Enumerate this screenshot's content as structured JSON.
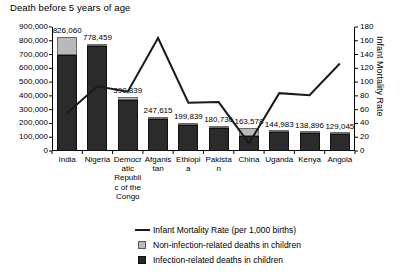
{
  "chart_data": {
    "type": "bar",
    "title": "Death before 5 years of age",
    "xlabel": "",
    "ylabel": "",
    "y2label": "Infant Mortality Rate",
    "grid": false,
    "legend_position": "bottom",
    "ylim": [
      0,
      900000
    ],
    "ytick_step": 100000,
    "y2lim": [
      0,
      180
    ],
    "y2tick_step": 20,
    "ytick_labels": [
      "900,000",
      "800,000",
      "700,000",
      "600,000",
      "500,000",
      "400,000",
      "300,000",
      "200,000",
      "100,000",
      "0"
    ],
    "y2tick_labels": [
      "180",
      "160",
      "140",
      "120",
      "100",
      "80",
      "60",
      "40",
      "20",
      "0"
    ],
    "categories": [
      "India",
      "Nigeria",
      "Democratic Republic of the Congo",
      "Afganistan",
      "Ethiopia",
      "Pakistan",
      "China",
      "Uganda",
      "Kenya",
      "Angola"
    ],
    "total_labels": [
      "826,060",
      "778,459",
      "390,839",
      "247,615",
      "199,839",
      "180,736",
      "163,578",
      "144,983",
      "138,896",
      "129,045"
    ],
    "totals": [
      826060,
      778459,
      390839,
      247615,
      199839,
      180736,
      163578,
      144983,
      138896,
      129045
    ],
    "series": [
      {
        "name": "Infection-related deaths in children",
        "type": "bar-segment",
        "color": "#2b2b2b",
        "values": [
          700000,
          762000,
          372000,
          232000,
          188000,
          170000,
          112000,
          136000,
          131000,
          122000
        ]
      },
      {
        "name": "Non-infection-related deaths in children",
        "type": "bar-segment",
        "color": "#b9b9b9",
        "values": [
          126060,
          16459,
          18839,
          15615,
          11839,
          10736,
          51578,
          8983,
          7896,
          7045
        ]
      },
      {
        "name": "Infant Mortality Rate (per 1,000 births)",
        "type": "line",
        "color": "#1a1a1a",
        "axis": "right",
        "values": [
          55,
          94,
          86,
          164,
          70,
          71,
          11,
          84,
          81,
          127
        ]
      }
    ],
    "legend": [
      {
        "key": "line",
        "label": "Infant Mortality Rate (per 1,000 births)"
      },
      {
        "key": "light",
        "label": "Non-infection-related deaths in children"
      },
      {
        "key": "dark",
        "label": "Infection-related deaths in children"
      }
    ]
  }
}
